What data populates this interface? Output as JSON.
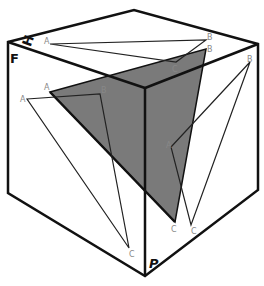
{
  "diagram": {
    "colors": {
      "edge": "#111111",
      "thin_line": "#222222",
      "shade": "#7a7a7a",
      "label": "#888888"
    },
    "plane_labels": {
      "horizontal": "H",
      "frontal": "F",
      "profile": "P"
    },
    "point_labels": {
      "a": "A",
      "b": "B",
      "c": "C"
    }
  }
}
